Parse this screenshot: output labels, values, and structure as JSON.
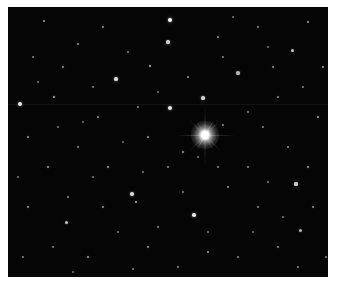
{
  "image": {
    "subject": "star field",
    "background_color": "#050505",
    "border_color": "#ffffff",
    "bright_star": {
      "x": 197,
      "y": 128,
      "color": "#ffffff"
    },
    "stars": [
      [
        162,
        13,
        2.2,
        1
      ],
      [
        160,
        35,
        1.6,
        0.8
      ],
      [
        108,
        72,
        1.6,
        0.85
      ],
      [
        12,
        97,
        2,
        0.9
      ],
      [
        162,
        101,
        2,
        0.9
      ],
      [
        195,
        91,
        1.6,
        0.8
      ],
      [
        230,
        66,
        1.6,
        0.7
      ],
      [
        284,
        43,
        1.5,
        0.75
      ],
      [
        46,
        90,
        1.4,
        0.7
      ],
      [
        288,
        177,
        1.6,
        0.8
      ],
      [
        186,
        208,
        1.8,
        0.9
      ],
      [
        124,
        187,
        1.7,
        0.85
      ],
      [
        58,
        215,
        1.5,
        0.75
      ],
      [
        292,
        223,
        1.5,
        0.7
      ],
      [
        128,
        195,
        1.3,
        0.7
      ],
      [
        142,
        59,
        1.3,
        0.7
      ],
      [
        36,
        14,
        1.1,
        0.6
      ],
      [
        70,
        37,
        1.2,
        0.6
      ],
      [
        95,
        20,
        1,
        0.55
      ],
      [
        120,
        45,
        1,
        0.5
      ],
      [
        210,
        30,
        1.1,
        0.55
      ],
      [
        250,
        20,
        1,
        0.5
      ],
      [
        300,
        15,
        1.1,
        0.6
      ],
      [
        315,
        60,
        1.2,
        0.6
      ],
      [
        270,
        90,
        1.1,
        0.55
      ],
      [
        310,
        110,
        1.2,
        0.65
      ],
      [
        255,
        120,
        1,
        0.5
      ],
      [
        280,
        140,
        1.1,
        0.55
      ],
      [
        240,
        160,
        1,
        0.5
      ],
      [
        300,
        160,
        1.2,
        0.6
      ],
      [
        20,
        130,
        1.1,
        0.6
      ],
      [
        40,
        160,
        1.2,
        0.6
      ],
      [
        70,
        140,
        1,
        0.5
      ],
      [
        90,
        110,
        1.1,
        0.55
      ],
      [
        100,
        160,
        1.2,
        0.6
      ],
      [
        140,
        130,
        1.1,
        0.55
      ],
      [
        160,
        160,
        1,
        0.5
      ],
      [
        220,
        180,
        1.1,
        0.55
      ],
      [
        250,
        200,
        1,
        0.5
      ],
      [
        270,
        240,
        1.1,
        0.55
      ],
      [
        230,
        250,
        1,
        0.5
      ],
      [
        200,
        245,
        1.2,
        0.6
      ],
      [
        170,
        260,
        1,
        0.5
      ],
      [
        140,
        240,
        1.1,
        0.55
      ],
      [
        110,
        225,
        1,
        0.5
      ],
      [
        80,
        250,
        1.2,
        0.6
      ],
      [
        45,
        240,
        1,
        0.5
      ],
      [
        20,
        200,
        1.1,
        0.55
      ],
      [
        15,
        250,
        1,
        0.5
      ],
      [
        60,
        190,
        1,
        0.5
      ],
      [
        95,
        200,
        1.1,
        0.55
      ],
      [
        150,
        220,
        1,
        0.5
      ],
      [
        175,
        185,
        1.1,
        0.5
      ],
      [
        210,
        160,
        1,
        0.5
      ],
      [
        260,
        175,
        1,
        0.5
      ],
      [
        305,
        200,
        1.1,
        0.55
      ],
      [
        318,
        250,
        1,
        0.5
      ],
      [
        290,
        260,
        1.1,
        0.5
      ],
      [
        180,
        70,
        1.1,
        0.55
      ],
      [
        215,
        50,
        1,
        0.5
      ],
      [
        55,
        60,
        1.1,
        0.55
      ],
      [
        25,
        50,
        1,
        0.5
      ],
      [
        85,
        80,
        1,
        0.5
      ],
      [
        130,
        100,
        1.1,
        0.5
      ],
      [
        240,
        105,
        1,
        0.5
      ],
      [
        265,
        60,
        1.1,
        0.55
      ],
      [
        295,
        80,
        1,
        0.5
      ],
      [
        50,
        120,
        1,
        0.45
      ],
      [
        115,
        135,
        1,
        0.45
      ],
      [
        175,
        145,
        1.2,
        0.6
      ],
      [
        215,
        118,
        1,
        0.5
      ],
      [
        190,
        150,
        1,
        0.45
      ],
      [
        10,
        170,
        1,
        0.45
      ],
      [
        85,
        170,
        1,
        0.45
      ],
      [
        135,
        165,
        1,
        0.45
      ],
      [
        245,
        225,
        1,
        0.45
      ],
      [
        275,
        210,
        1,
        0.45
      ],
      [
        200,
        225,
        1,
        0.45
      ],
      [
        65,
        265,
        1,
        0.45
      ],
      [
        125,
        262,
        1,
        0.45
      ],
      [
        225,
        10,
        1,
        0.45
      ],
      [
        260,
        40,
        1,
        0.45
      ],
      [
        150,
        85,
        1,
        0.45
      ],
      [
        75,
        115,
        1,
        0.45
      ],
      [
        30,
        75,
        1,
        0.45
      ]
    ]
  }
}
